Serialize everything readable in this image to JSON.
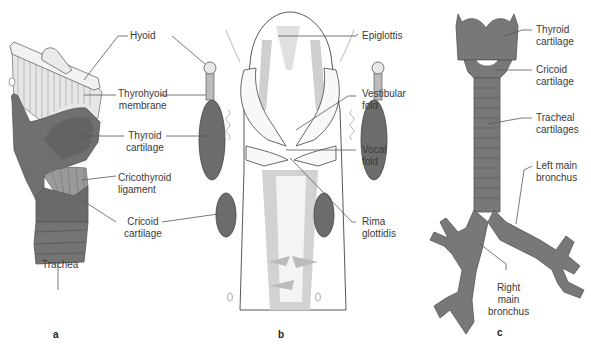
{
  "figure": {
    "panels": [
      {
        "id": "a",
        "letter": "a",
        "view": "larynx-lateral",
        "labels": [
          {
            "key": "hyoid",
            "line1": "Hyoid",
            "line2": ""
          },
          {
            "key": "thyrohyoid_membrane",
            "line1": "Thyrohyoid",
            "line2": "membrane"
          },
          {
            "key": "thyroid_cartilage",
            "line1": "Thyroid",
            "line2": "cartilage"
          },
          {
            "key": "cricothyroid_ligament",
            "line1": "Cricothyroid",
            "line2": "ligament"
          },
          {
            "key": "cricoid_cartilage",
            "line1": "Cricoid",
            "line2": "cartilage"
          },
          {
            "key": "trachea",
            "line1": "Trachea",
            "line2": ""
          }
        ]
      },
      {
        "id": "b",
        "letter": "b",
        "view": "larynx-coronal-section",
        "labels": [
          {
            "key": "epiglottis",
            "line1": "Epiglottis",
            "line2": ""
          },
          {
            "key": "vestibular_fold",
            "line1": "Vestibular",
            "line2": "fold"
          },
          {
            "key": "vocal_fold",
            "line1": "Vocal",
            "line2": "fold"
          },
          {
            "key": "rima_glottidis",
            "line1": "Rima",
            "line2": "glottidis"
          }
        ]
      },
      {
        "id": "c",
        "letter": "c",
        "view": "airway-anterior",
        "labels": [
          {
            "key": "thyroid_cartilage",
            "line1": "Thyroid",
            "line2": "cartilage"
          },
          {
            "key": "cricoid_cartilage",
            "line1": "Cricoid",
            "line2": "cartilage"
          },
          {
            "key": "tracheal_cartilages",
            "line1": "Tracheal",
            "line2": "cartilages"
          },
          {
            "key": "left_main_bronchus",
            "line1": "Left main",
            "line2": "bronchus"
          },
          {
            "key": "right_main_bronchus",
            "line1": "Right",
            "line2": "main",
            "line3": "bronchus"
          }
        ]
      }
    ],
    "colors": {
      "cartilage_dark": "#6e6e6e",
      "cartilage_mid": "#8a8a8a",
      "membrane_light": "#e4e4e4",
      "section_light": "#c8c8c8",
      "leader_line": "#555555",
      "text": "#3a3a3a"
    }
  }
}
